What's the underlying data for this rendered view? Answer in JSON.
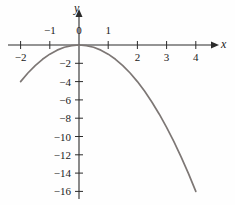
{
  "figure": {
    "axis_labels": {
      "x": "x",
      "y": "y"
    },
    "curve_color": "#7d7775",
    "axis_color": "#2b2b2b",
    "text_color": "#1a1a1a"
  },
  "chart_data": {
    "type": "line",
    "title": "",
    "xlabel": "x",
    "ylabel": "y",
    "equation": "y = -x^2",
    "xlim": [
      -2,
      4
    ],
    "ylim": [
      -16,
      0
    ],
    "grid": false,
    "legend": null,
    "x_ticks": [
      {
        "value": -2,
        "label": "−2",
        "position": "below"
      },
      {
        "value": -1,
        "label": "−1",
        "position": "above"
      },
      {
        "value": 0,
        "label": "0",
        "position": "above"
      },
      {
        "value": 1,
        "label": "1",
        "position": "above"
      },
      {
        "value": 2,
        "label": "2",
        "position": "below"
      },
      {
        "value": 3,
        "label": "3",
        "position": "below"
      },
      {
        "value": 4,
        "label": "4",
        "position": "below"
      }
    ],
    "y_ticks": [
      {
        "value": -2,
        "label": "−2"
      },
      {
        "value": -4,
        "label": "−4"
      },
      {
        "value": -6,
        "label": "−6"
      },
      {
        "value": -8,
        "label": "−8"
      },
      {
        "value": -10,
        "label": "−10"
      },
      {
        "value": -12,
        "label": "−12"
      },
      {
        "value": -14,
        "label": "−14"
      },
      {
        "value": -16,
        "label": "−16"
      }
    ],
    "x": [
      -2,
      -1.75,
      -1.5,
      -1.25,
      -1,
      -0.75,
      -0.5,
      -0.25,
      0,
      0.25,
      0.5,
      0.75,
      1,
      1.25,
      1.5,
      1.75,
      2,
      2.25,
      2.5,
      2.75,
      3,
      3.25,
      3.5,
      3.75,
      4
    ],
    "y": [
      -4,
      -3.0625,
      -2.25,
      -1.5625,
      -1,
      -0.5625,
      -0.25,
      -0.0625,
      0,
      -0.0625,
      -0.25,
      -0.5625,
      -1,
      -1.5625,
      -2.25,
      -3.0625,
      -4,
      -5.0625,
      -6.25,
      -7.5625,
      -9,
      -10.5625,
      -12.25,
      -14.0625,
      -16
    ]
  }
}
